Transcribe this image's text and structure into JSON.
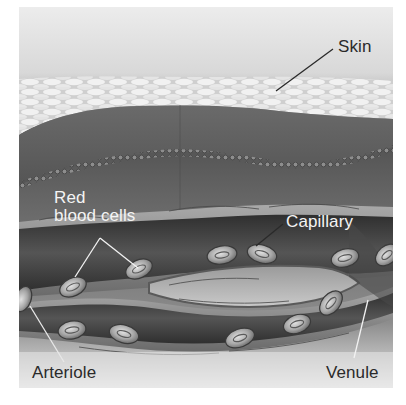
{
  "figure": {
    "labels": {
      "skin": "Skin",
      "red_blood_cells_line1": "Red",
      "red_blood_cells_line2": "blood cells",
      "capillary": "Capillary",
      "arteriole": "Arteriole",
      "venule": "Venule"
    },
    "colors": {
      "background": "#ffffff",
      "sky_top": "#e6e6e6",
      "sky_bottom": "#8a8a8a",
      "epidermis": "#dcdcdc",
      "dermis": "#5e5e5e",
      "deep_tissue": "#6f6f6f",
      "vessel_wall": "#8c8c8c",
      "vessel_lumen": "#3c3c3c",
      "rbc": "#bdbdbd",
      "label_dark": "#2a2a2a",
      "label_light": "#f4f4f4"
    }
  }
}
